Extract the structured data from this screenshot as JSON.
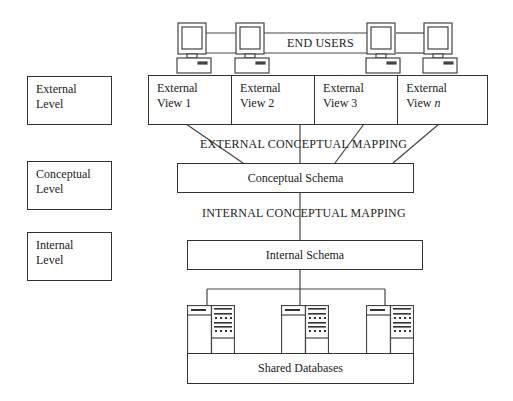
{
  "diagram": {
    "end_users": {
      "label": "END USERS",
      "computers": [
        "computer-1",
        "computer-2",
        "computer-3",
        "computer-4"
      ]
    },
    "levels": [
      {
        "line1": "External",
        "line2": "Level"
      },
      {
        "line1": "Conceptual",
        "line2": "Level"
      },
      {
        "line1": "Internal",
        "line2": "Level"
      }
    ],
    "external_views": [
      {
        "line1": "External",
        "line2": "View 1"
      },
      {
        "line1": "External",
        "line2": "View 2"
      },
      {
        "line1": "External",
        "line2": "View 3"
      },
      {
        "line1": "External",
        "line2": "View ",
        "italic": "n"
      }
    ],
    "external_conceptual_mapping": "EXTERNAL CONCEPTUAL MAPPING",
    "conceptual_schema": "Conceptual Schema",
    "internal_conceptual_mapping": "INTERNAL CONCEPTUAL MAPPING",
    "internal_schema": "Internal Schema",
    "servers": [
      "server-1",
      "server-2",
      "server-3"
    ],
    "shared_databases": "Shared Databases",
    "colors": {
      "line": "#333333",
      "background": "#ffffff",
      "text": "#222222"
    }
  }
}
